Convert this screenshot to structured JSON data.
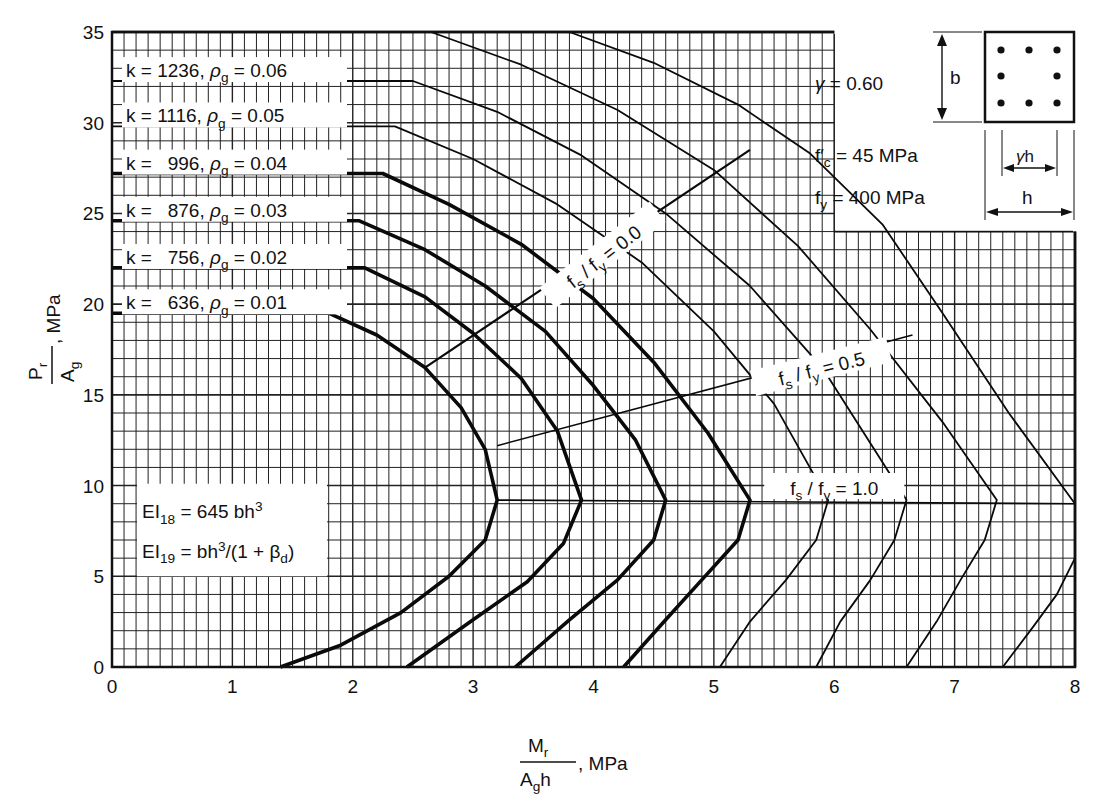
{
  "chart_data": {
    "type": "line",
    "title": "",
    "xlabel": "M_r / (A_g h), MPa",
    "ylabel": "P_r / A_g, MPa",
    "xlabel_parts": {
      "num": "M",
      "num_sub": "r",
      "den": "A",
      "den_sub": "g",
      "den_tail": "h",
      "unit": ", MPa"
    },
    "ylabel_parts": {
      "num": "P",
      "num_sub": "r",
      "den": "A",
      "den_sub": "g",
      "unit": ", MPa"
    },
    "xlim": [
      0,
      8
    ],
    "ylim": [
      0,
      35
    ],
    "xticks": [
      0,
      1,
      2,
      3,
      4,
      5,
      6,
      7,
      8
    ],
    "yticks": [
      0,
      5,
      10,
      15,
      20,
      25,
      30,
      35
    ],
    "grid": {
      "x_minor": 0.1,
      "y_minor": 1,
      "x_major": 1,
      "y_major": 5
    },
    "series": [
      {
        "name": "k = 636, ρg = 0.01",
        "k": "636",
        "rho": "0.01",
        "heavy": true,
        "points": [
          [
            0,
            19.5
          ],
          [
            1.8,
            19.5
          ],
          [
            2.2,
            18.3
          ],
          [
            2.6,
            16.5
          ],
          [
            2.9,
            14.3
          ],
          [
            3.1,
            12.0
          ],
          [
            3.2,
            9.2
          ],
          [
            3.1,
            7.0
          ],
          [
            2.8,
            5.0
          ],
          [
            2.4,
            3.0
          ],
          [
            1.9,
            1.2
          ],
          [
            1.4,
            0
          ]
        ]
      },
      {
        "name": "k = 756, ρg = 0.02",
        "k": "756",
        "rho": "0.02",
        "heavy": true,
        "points": [
          [
            0,
            22.0
          ],
          [
            2.1,
            22.0
          ],
          [
            2.6,
            20.4
          ],
          [
            3.0,
            18.4
          ],
          [
            3.4,
            15.9
          ],
          [
            3.7,
            13.0
          ],
          [
            3.9,
            9.2
          ],
          [
            3.75,
            6.8
          ],
          [
            3.45,
            4.7
          ],
          [
            3.0,
            2.6
          ],
          [
            2.45,
            0
          ]
        ]
      },
      {
        "name": "k = 876, ρg = 0.03",
        "k": "876",
        "rho": "0.03",
        "heavy": true,
        "points": [
          [
            0,
            24.6
          ],
          [
            2.05,
            24.6
          ],
          [
            2.6,
            23.0
          ],
          [
            3.1,
            21.0
          ],
          [
            3.6,
            18.5
          ],
          [
            4.0,
            15.5
          ],
          [
            4.35,
            12.5
          ],
          [
            4.6,
            9.2
          ],
          [
            4.5,
            7.0
          ],
          [
            4.2,
            4.8
          ],
          [
            3.8,
            2.6
          ],
          [
            3.35,
            0
          ]
        ]
      },
      {
        "name": "k = 996, ρg = 0.04",
        "k": "996",
        "rho": "0.04",
        "heavy": true,
        "points": [
          [
            0,
            27.2
          ],
          [
            2.25,
            27.2
          ],
          [
            2.8,
            25.5
          ],
          [
            3.4,
            23.3
          ],
          [
            4.0,
            20.3
          ],
          [
            4.5,
            16.8
          ],
          [
            4.95,
            12.9
          ],
          [
            5.3,
            9.2
          ],
          [
            5.2,
            7.0
          ],
          [
            4.9,
            4.8
          ],
          [
            4.6,
            2.6
          ],
          [
            4.25,
            0
          ]
        ]
      },
      {
        "name": "k = 1116, ρg = 0.05",
        "k": "1116",
        "rho": "0.05",
        "heavy": false,
        "points": [
          [
            0,
            29.8
          ],
          [
            2.35,
            29.8
          ],
          [
            3.0,
            28.0
          ],
          [
            3.7,
            25.5
          ],
          [
            4.4,
            22.3
          ],
          [
            5.0,
            18.5
          ],
          [
            5.5,
            14.5
          ],
          [
            5.95,
            9.2
          ],
          [
            5.85,
            7.0
          ],
          [
            5.6,
            4.8
          ],
          [
            5.3,
            2.5
          ],
          [
            5.05,
            0
          ]
        ]
      },
      {
        "name": "k = 1236, ρg = 0.06",
        "k": "1236",
        "rho": "0.06",
        "heavy": false,
        "points": [
          [
            0,
            32.3
          ],
          [
            2.5,
            32.3
          ],
          [
            3.2,
            30.6
          ],
          [
            3.9,
            28.2
          ],
          [
            4.6,
            25.0
          ],
          [
            5.3,
            21.0
          ],
          [
            5.9,
            16.5
          ],
          [
            6.6,
            9.2
          ],
          [
            6.5,
            7.0
          ],
          [
            6.3,
            4.8
          ],
          [
            6.05,
            2.5
          ],
          [
            5.85,
            0
          ]
        ]
      },
      {
        "name": "unlabeled curve 7",
        "k": "",
        "rho": "",
        "heavy": false,
        "points": [
          [
            2.65,
            35
          ],
          [
            3.4,
            33.2
          ],
          [
            4.2,
            30.7
          ],
          [
            5.0,
            27.4
          ],
          [
            5.7,
            23.2
          ],
          [
            6.3,
            18.6
          ],
          [
            6.9,
            13.5
          ],
          [
            7.35,
            9.2
          ],
          [
            7.25,
            7.0
          ],
          [
            7.05,
            4.8
          ],
          [
            6.85,
            2.5
          ],
          [
            6.6,
            0
          ]
        ]
      },
      {
        "name": "unlabeled curve 8",
        "k": "",
        "rho": "",
        "heavy": false,
        "points": [
          [
            3.8,
            35
          ],
          [
            4.5,
            33.3
          ],
          [
            5.2,
            31.0
          ],
          [
            5.8,
            28.3
          ],
          [
            6.4,
            24.4
          ],
          [
            6.9,
            19.5
          ],
          [
            7.45,
            14.0
          ],
          [
            8.0,
            9.0
          ]
        ]
      },
      {
        "name": "unlabeled curve 8 lower",
        "k": "",
        "rho": "",
        "heavy": false,
        "points": [
          [
            8.0,
            6.0
          ],
          [
            7.85,
            4.0
          ],
          [
            7.65,
            2.2
          ],
          [
            7.4,
            0
          ]
        ]
      }
    ],
    "stress_lines": [
      {
        "name": "fs/fy = 0.0",
        "label": "f_s / f_y = 0.0",
        "points": [
          [
            2.6,
            16.5
          ],
          [
            5.3,
            28.5
          ]
        ],
        "label_at": [
          4.1,
          22.5
        ],
        "label_angle": -38
      },
      {
        "name": "fs/fy = 0.5",
        "label": "f_s / f_y = 0.5",
        "points": [
          [
            3.2,
            12.2
          ],
          [
            6.65,
            18.3
          ]
        ],
        "label_at": [
          5.9,
          16.3
        ],
        "label_angle": -14
      },
      {
        "name": "fs/fy = 1.0",
        "label": "f_s / f_y = 1.0",
        "points": [
          [
            3.2,
            9.2
          ],
          [
            8.0,
            9.0
          ]
        ],
        "label_at": [
          6.0,
          9.7
        ],
        "label_angle": 0
      }
    ],
    "annotations": {
      "series_labels": [
        {
          "k": "1236",
          "rho": "0.06",
          "y": 32.9
        },
        {
          "k": "1116",
          "rho": "0.05",
          "y": 30.4
        },
        {
          "k": "996",
          "rho": "0.04",
          "y": 27.8
        },
        {
          "k": "876",
          "rho": "0.03",
          "y": 25.2
        },
        {
          "k": "756",
          "rho": "0.02",
          "y": 22.6
        },
        {
          "k": "636",
          "rho": "0.01",
          "y": 20.1
        }
      ],
      "ei_box": {
        "line1_main": "EI",
        "line1_sub": "18",
        "line1_rest": " = 645 bh",
        "line1_sup": "3",
        "line2_main": "EI",
        "line2_sub": "19",
        "line2_rest": " = bh",
        "line2_sup": "3",
        "line2_tail": "/(1 + β",
        "line2_tail_sub": "d",
        "line2_close": ")"
      },
      "params": {
        "gamma_label": "γ",
        "gamma_value": "= 0.60",
        "fc_label": "f′",
        "fc_sub": "c",
        "fc_value": "=  45  MPa",
        "fy_label": "f",
        "fy_sub": "y",
        "fy_value": "= 400  MPa"
      },
      "section_diagram": {
        "dim_b": "b",
        "dim_gh": "γh",
        "dim_h": "h",
        "bars": 8
      }
    }
  }
}
